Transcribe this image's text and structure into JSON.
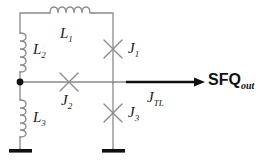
{
  "figure": {
    "name": "sfq-josephson-circuit-diagram",
    "background_color": "#ffffff",
    "wire_color": "#808080",
    "accent_color": "#000000"
  },
  "labels": {
    "l1": "L",
    "l1_sub": "1",
    "l2": "L",
    "l2_sub": "2",
    "l3": "L",
    "l3_sub": "3",
    "j1": "J",
    "j1_sub": "1",
    "j2": "J",
    "j2_sub": "2",
    "j3": "J",
    "j3_sub": "3",
    "jtl": "J",
    "jtl_sub": "TL",
    "sfq_out": "SFQ",
    "sfq_out_sub": "out"
  },
  "components": {
    "inductors": [
      {
        "id": "L1",
        "orientation": "horizontal",
        "turns": 5
      },
      {
        "id": "L2",
        "orientation": "vertical",
        "turns": 5
      },
      {
        "id": "L3",
        "orientation": "vertical",
        "turns": 5
      }
    ],
    "junctions": [
      {
        "id": "J1",
        "symbol": "x-cross",
        "on": "right-vertical-branch"
      },
      {
        "id": "J2",
        "symbol": "x-cross",
        "on": "horizontal-branch"
      },
      {
        "id": "J3",
        "symbol": "x-cross",
        "on": "right-vertical-branch"
      }
    ],
    "grounds": [
      {
        "id": "ground-left",
        "symbol": "ground"
      },
      {
        "id": "ground-right",
        "symbol": "ground"
      }
    ],
    "nodes": [
      {
        "id": "node-left",
        "symbol": "solid-dot"
      }
    ],
    "output": {
      "id": "sfq-output-arrow",
      "symbol": "arrow-right"
    }
  }
}
